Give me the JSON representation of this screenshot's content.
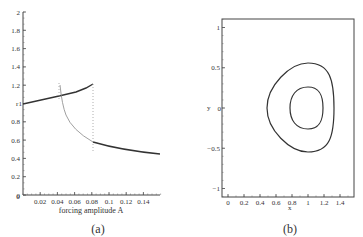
{
  "chart_data": [
    {
      "type": "line",
      "panel": "(a)",
      "xlabel": "forcing amplitude A",
      "ylabel": "r",
      "xlim": [
        0,
        0.15
      ],
      "ylim": [
        0,
        2
      ],
      "xticks": [
        "0.02",
        "0.04",
        "0.06",
        "0.08",
        "0.1",
        "0.12",
        "0.14"
      ],
      "yticks": [
        "0",
        "0.2",
        "0.4",
        "0.6",
        "0.8",
        "1",
        "1.2",
        "1.4",
        "1.6",
        "1.8",
        "2"
      ],
      "grid": false,
      "series": [
        {
          "name": "upper stable branch",
          "x": [
            0,
            0.02,
            0.04,
            0.06,
            0.077
          ],
          "y": [
            1.0,
            1.04,
            1.08,
            1.13,
            1.22
          ]
        },
        {
          "name": "unstable branch",
          "x": [
            0.042,
            0.045,
            0.05,
            0.06,
            0.07,
            0.08
          ],
          "y": [
            1.22,
            1.05,
            0.9,
            0.76,
            0.66,
            0.6
          ]
        },
        {
          "name": "lower stable branch",
          "x": [
            0.08,
            0.1,
            0.12,
            0.15
          ],
          "y": [
            0.6,
            0.53,
            0.48,
            0.43
          ]
        }
      ],
      "annotations": [
        "dotted vertical jump lines near A=0.042 and A=0.08"
      ]
    },
    {
      "type": "line",
      "panel": "(b)",
      "xlabel": "x",
      "ylabel": "y",
      "xlim": [
        -0.1,
        1.55
      ],
      "ylim": [
        -1.1,
        1.1
      ],
      "xticks": [
        "0",
        "0.2",
        "0.4",
        "0.6",
        "0.8",
        "1",
        "1.2",
        "1.4"
      ],
      "yticks": [
        "-1",
        "-0.5",
        "0",
        "0.5",
        "1"
      ],
      "grid": false,
      "series": [
        {
          "name": "outer orbit",
          "x_range": [
            0.5,
            1.32
          ],
          "y_range": [
            -0.55,
            0.55
          ]
        },
        {
          "name": "inner orbit",
          "x_range": [
            0.8,
            1.2
          ],
          "y_range": [
            -0.26,
            0.26
          ]
        }
      ]
    }
  ],
  "captions": {
    "a": "(a)",
    "b": "(b)"
  },
  "labels": {
    "a_xlabel": "forcing amplitude A",
    "a_ylabel": "r",
    "b_xlabel": "x",
    "b_ylabel": "y"
  }
}
